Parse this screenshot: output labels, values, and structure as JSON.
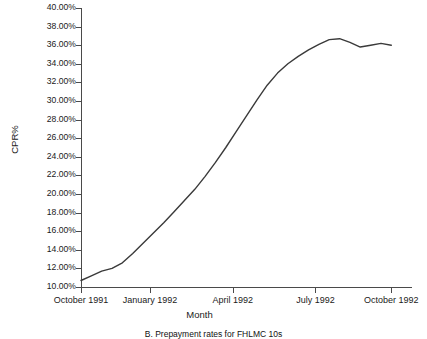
{
  "chart_data": {
    "type": "line",
    "title": "",
    "caption": "B. Prepayment rates for FHLMC 10s",
    "xlabel": "Month",
    "ylabel": "CPR%",
    "ylim": [
      10,
      40
    ],
    "ytick_values": [
      10,
      12,
      14,
      16,
      18,
      20,
      22,
      24,
      26,
      28,
      30,
      32,
      34,
      36,
      38,
      40
    ],
    "ytick_labels": [
      "10.00%",
      "12.00%",
      "14.00%",
      "16.00%",
      "18.00%",
      "20.00%",
      "22.00%",
      "24.00%",
      "26.00%",
      "28.00%",
      "30.00%",
      "32.00%",
      "34.00%",
      "36.00%",
      "38.00%",
      "40.00%"
    ],
    "xtick_labels": [
      "October 1991",
      "January 1992",
      "April 1992",
      "July 1992",
      "October 1992"
    ],
    "xtick_positions": [
      0.0,
      0.2083,
      0.4583,
      0.7083,
      0.9375
    ],
    "xlim_months": [
      0,
      16
    ],
    "grid": false,
    "legend": false,
    "line_color": "#3a3a3a",
    "line_width": 1.4,
    "series": [
      {
        "name": "CPR%",
        "x": [
          0,
          0.5,
          1,
          1.5,
          2,
          2.5,
          3,
          3.5,
          4,
          4.5,
          5,
          5.5,
          6,
          6.5,
          7,
          7.5,
          8,
          8.5,
          9,
          9.5,
          10,
          10.5,
          11,
          11.5,
          12,
          12.5,
          13,
          13.5,
          14,
          14.5,
          15
        ],
        "values": [
          10.7,
          11.2,
          11.7,
          12.0,
          12.6,
          13.6,
          14.7,
          15.8,
          16.9,
          18.1,
          19.3,
          20.5,
          21.9,
          23.4,
          25.0,
          26.7,
          28.4,
          30.1,
          31.7,
          33.0,
          34.0,
          34.8,
          35.5,
          36.1,
          36.6,
          36.7,
          36.3,
          35.8,
          36.0,
          36.2,
          36.0
        ]
      }
    ]
  }
}
